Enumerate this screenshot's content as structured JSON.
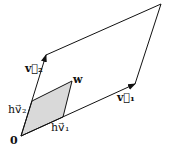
{
  "diagram": {
    "title": "",
    "points": {
      "origin": {
        "x": 21,
        "y": 136
      },
      "v1_tip": {
        "x": 135,
        "y": 84
      },
      "v2_tip": {
        "x": 46,
        "y": 55
      },
      "far_corner": {
        "x": 161,
        "y": 4
      },
      "hv1": {
        "x": 63,
        "y": 117
      },
      "hv2": {
        "x": 32,
        "y": 101
      },
      "w": {
        "x": 72,
        "y": 81
      }
    },
    "labels": {
      "origin": "0",
      "v1": "v⃗₁",
      "v2": "v⃗₂",
      "hv1": "hv⃗₁",
      "hv2": "hv⃗₂",
      "w": "w"
    },
    "colors": {
      "stroke": "#111111",
      "fill": "#d9d9d9",
      "background": "#ffffff"
    }
  }
}
